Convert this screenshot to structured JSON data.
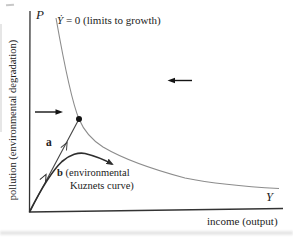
{
  "colors": {
    "background": "#ffffff",
    "axis": "#333333",
    "text": "#222222",
    "limits_curve": "#8c8c8c",
    "kuznets_curve": "#2e2e2e",
    "path_a": "#444444",
    "arrow": "#141414"
  },
  "axes": {
    "vertical_symbol": "P",
    "vertical_title": "pollution (environmental degradation)",
    "horizontal_symbol": "Y",
    "horizontal_title": "income (output)"
  },
  "labels": {
    "limits_symbol": "Ẏ",
    "limits_rest": " = 0 (limits to growth)",
    "path_a": "a",
    "kuznets_b": "b",
    "kuznets_rest": " (environmental",
    "kuznets_line2": "Kuznets curve)"
  }
}
